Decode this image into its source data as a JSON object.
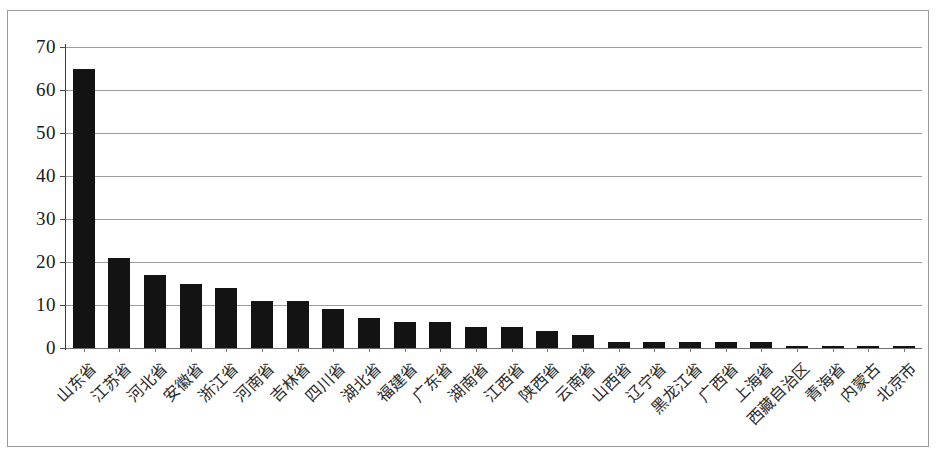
{
  "chart_data": {
    "type": "bar",
    "title": "",
    "subtitle": "",
    "xlabel": "",
    "ylabel": "",
    "ylim": [
      0,
      70
    ],
    "yticks": [
      0,
      10,
      20,
      30,
      40,
      50,
      60,
      70
    ],
    "grid": true,
    "legend": false,
    "legend_position": "none",
    "bar_color": "#131313",
    "gridline_color": "#9c9c9c",
    "axis_color": "#3b3b3b",
    "orientation": "vertical",
    "label_rotation": -45,
    "categories": [
      "山东省",
      "江苏省",
      "河北省",
      "安徽省",
      "浙江省",
      "河南省",
      "吉林省",
      "四川省",
      "湖北省",
      "福建省",
      "广东省",
      "湖南省",
      "江西省",
      "陕西省",
      "云南省",
      "山西省",
      "辽宁省",
      "黑龙江省",
      "广西省",
      "上海省",
      "西藏自治区",
      "青海省",
      "内蒙古",
      "北京市"
    ],
    "values": [
      65,
      21,
      17,
      15,
      14,
      11,
      11,
      9,
      7,
      6,
      6,
      5,
      5,
      4,
      3,
      1.5,
      1.5,
      1.5,
      1.5,
      1.5,
      0.5,
      0.5,
      0.5,
      0.5
    ]
  }
}
